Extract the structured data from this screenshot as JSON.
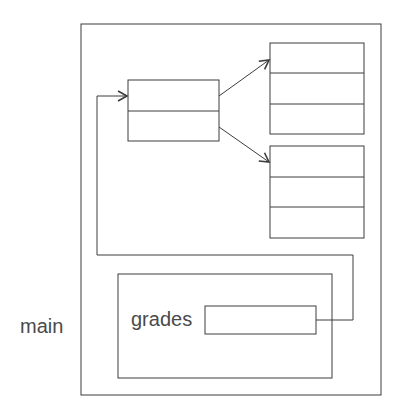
{
  "diagram": {
    "frame_label": "main",
    "variable_label": "grades",
    "colors": {
      "stroke": "#3c3c3c",
      "text": "#4a4a4a",
      "background": "#ffffff"
    },
    "nodes": [
      {
        "id": "outer-region",
        "type": "container"
      },
      {
        "id": "array-of-refs",
        "type": "array",
        "cells": 2
      },
      {
        "id": "row-array-top",
        "type": "array",
        "cells": 3
      },
      {
        "id": "row-array-bottom",
        "type": "array",
        "cells": 3
      },
      {
        "id": "main-frame",
        "type": "stack-frame",
        "label": "main"
      },
      {
        "id": "grades-slot",
        "type": "variable",
        "label": "grades"
      }
    ],
    "edges": [
      {
        "from": "grades-slot",
        "to": "array-of-refs"
      },
      {
        "from": "array-of-refs.cell0",
        "to": "row-array-top"
      },
      {
        "from": "array-of-refs.cell1",
        "to": "row-array-bottom"
      }
    ]
  }
}
